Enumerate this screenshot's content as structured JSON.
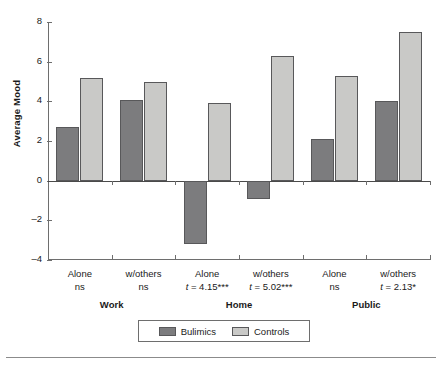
{
  "chart_data": {
    "type": "bar",
    "title": "",
    "xlabel": "",
    "ylabel": "Average Mood",
    "ylim": [
      -4,
      8
    ],
    "yticks": [
      8,
      6,
      4,
      2,
      0,
      -2,
      -4
    ],
    "ytick_labels": [
      "8",
      "6",
      "4",
      "2",
      "0",
      "–2",
      "–4"
    ],
    "grid": false,
    "legend_position": "bottom-center",
    "categories": [
      "Alone",
      "w/others",
      "Alone",
      "w/others",
      "Alone",
      "w/others"
    ],
    "group_labels": [
      "Work",
      "Home",
      "Public"
    ],
    "category_stats": [
      "ns",
      "ns",
      "t = 4.15***",
      "t = 5.02***",
      "ns",
      "t = 2.13*"
    ],
    "series": [
      {
        "name": "Bulimics",
        "color": "#7c7c7e",
        "values": [
          2.7,
          4.05,
          -3.2,
          -0.9,
          2.1,
          4.0
        ]
      },
      {
        "name": "Controls",
        "color": "#c9c9c7",
        "values": [
          5.2,
          5.0,
          3.9,
          6.3,
          5.3,
          7.5
        ]
      }
    ]
  },
  "axis": {
    "y_title": "Average Mood",
    "tick_0": "8",
    "tick_1": "6",
    "tick_2": "4",
    "tick_3": "2",
    "tick_4": "0",
    "tick_5": "–2",
    "tick_6": "–4"
  },
  "categories": [
    {
      "name": "Alone",
      "stat": "ns",
      "stat_italic": "",
      "stat_rest": "ns"
    },
    {
      "name": "w/others",
      "stat": "ns",
      "stat_italic": "",
      "stat_rest": "ns"
    },
    {
      "name": "Alone",
      "stat": "t = 4.15***",
      "stat_italic": "t",
      "stat_rest": " = 4.15***"
    },
    {
      "name": "w/others",
      "stat": "t = 5.02***",
      "stat_italic": "t",
      "stat_rest": " = 5.02***"
    },
    {
      "name": "Alone",
      "stat": "ns",
      "stat_italic": "",
      "stat_rest": "ns"
    },
    {
      "name": "w/others",
      "stat": "t = 2.13*",
      "stat_italic": "t",
      "stat_rest": " = 2.13*"
    }
  ],
  "groups": [
    {
      "label": "Work"
    },
    {
      "label": "Home"
    },
    {
      "label": "Public"
    }
  ],
  "legend": {
    "items": [
      {
        "label": "Bulimics",
        "color": "#7c7c7e"
      },
      {
        "label": "Controls",
        "color": "#c9c9c7"
      }
    ]
  }
}
